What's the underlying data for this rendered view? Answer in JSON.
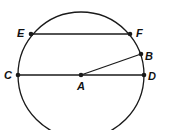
{
  "diagram": {
    "type": "circle-geometry",
    "stroke_color": "#1a1a1a",
    "background": "#ffffff",
    "circle": {
      "center": "A",
      "cx": 81,
      "cy": 75,
      "r": 63
    },
    "points": [
      {
        "name": "A",
        "label": "A",
        "x": 81,
        "y": 75,
        "label_x": 77,
        "label_y": 90
      },
      {
        "name": "B",
        "label": "B",
        "x": 141,
        "y": 54,
        "label_x": 145,
        "label_y": 60
      },
      {
        "name": "C",
        "label": "C",
        "x": 18,
        "y": 75,
        "label_x": 4,
        "label_y": 79
      },
      {
        "name": "D",
        "label": "D",
        "x": 144,
        "y": 75,
        "label_x": 148,
        "label_y": 80
      },
      {
        "name": "E",
        "label": "E",
        "x": 31,
        "y": 34,
        "label_x": 17,
        "label_y": 37
      },
      {
        "name": "F",
        "label": "F",
        "x": 130,
        "y": 34,
        "label_x": 136,
        "label_y": 37
      }
    ],
    "segments": [
      {
        "name": "chord-EF",
        "from": "E",
        "to": "F"
      },
      {
        "name": "diameter-CD",
        "from": "C",
        "to": "D"
      },
      {
        "name": "radius-AB",
        "from": "A",
        "to": "B"
      }
    ]
  }
}
